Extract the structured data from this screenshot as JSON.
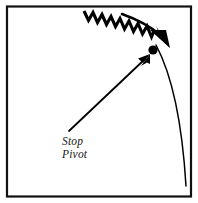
{
  "figure": {
    "name": "stop-pivot-mechanism-diagram",
    "background_color": "#ffffff",
    "ink_color": "#000000",
    "border": {
      "name": "figure-frame",
      "color": "#111111",
      "width_px": 2,
      "inset_px": 6
    },
    "labels": {
      "line1": "Stop",
      "line2": "Pivot"
    },
    "elements": {
      "spring_label": "zigzag-spring",
      "spring_teeth": 13,
      "motion_arrow_label": "curved-motion-arrow",
      "pivot_dot_label": "pivot-point-dot",
      "trajectory_label": "trajectory-arc",
      "pointer_label": "stop-pivot-pointer-arrow"
    }
  }
}
